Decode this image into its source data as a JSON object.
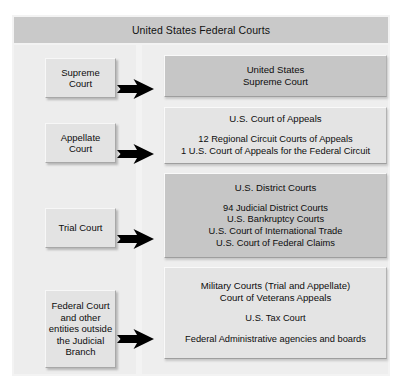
{
  "title": "United States Federal Courts",
  "rows": [
    {
      "side_label": "Supreme\nCourt",
      "head": "United States\nSupreme Court",
      "body": "",
      "shade": "dark",
      "arrow": "right-arrow-icon"
    },
    {
      "side_label": "Appellate\nCourt",
      "head": "U.S. Court of Appeals",
      "body": "12 Regional Circuit Courts of Appeals\n1 U.S. Court of Appeals for the Federal Circuit",
      "shade": "light",
      "arrow": "right-arrow-icon"
    },
    {
      "side_label": "Trial Court",
      "head": "U.S. District Courts",
      "body": "94 Judicial District Courts\nU.S. Bankruptcy Courts\nU.S. Court of International Trade\nU.S. Court of Federal Claims",
      "shade": "dark",
      "arrow": "right-arrow-icon"
    },
    {
      "side_label": "Federal Court and other entities outside the Judicial Branch",
      "head": "Military Courts (Trial and Appellate)\nCourt of Veterans Appeals",
      "body": "U.S. Tax Court",
      "body2": "Federal Administrative agencies and boards",
      "shade": "light",
      "arrow": "right-arrow-icon"
    }
  ],
  "colors": {
    "page_background": "#ffffff",
    "frame_background": "#f3f3f3",
    "title_bar": "#c9c9c9",
    "panel_left": "#ededed",
    "panel_right": "#eeeeee",
    "box_dark": "#c6c6c6",
    "box_light": "#e4e4e4",
    "side_box": "#e3e3e3",
    "arrow": "#000000",
    "text": "#0d0d0d"
  }
}
